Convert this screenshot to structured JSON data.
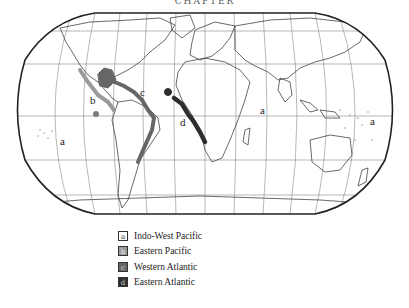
{
  "header": {
    "cut_title": "CHAPTER"
  },
  "map": {
    "labels": [
      {
        "id": "a-west",
        "text": "a"
      },
      {
        "id": "b",
        "text": "b"
      },
      {
        "id": "c",
        "text": "c"
      },
      {
        "id": "d",
        "text": "d"
      },
      {
        "id": "a-indian",
        "text": "a"
      },
      {
        "id": "a-pacific",
        "text": "a"
      }
    ],
    "colors": {
      "indo_west_pacific": "#ffffff",
      "eastern_pacific": "#9a9a9a",
      "western_atlantic": "#666666",
      "eastern_atlantic": "#2e2e2e",
      "coastline": "#444444",
      "graticule": "#777777"
    }
  },
  "legend": {
    "items": [
      {
        "key": "a",
        "label": "Indo-West Pacific",
        "color": "#ffffff"
      },
      {
        "key": "b",
        "label": "Eastern Pacific",
        "color": "#9a9a9a"
      },
      {
        "key": "c",
        "label": "Western Atlantic",
        "color": "#666666"
      },
      {
        "key": "d",
        "label": "Eastern Atlantic",
        "color": "#2e2e2e"
      }
    ]
  }
}
